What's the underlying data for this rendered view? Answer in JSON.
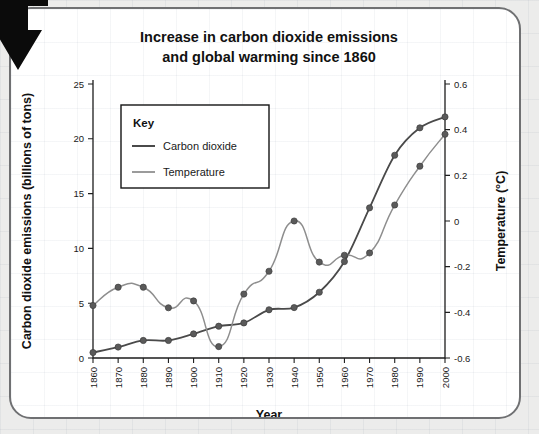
{
  "figure": {
    "title_line1": "Increase in carbon dioxide emissions",
    "title_line2": "and global warming since 1860",
    "corner_marker": "black-arrow-pointer"
  },
  "legend": {
    "heading": "Key",
    "entries": [
      {
        "label": "Carbon dioxide",
        "color": "#4a4a4a",
        "swatch": "line-swatch"
      },
      {
        "label": "Temperature",
        "color": "#9b9b9b",
        "swatch": "line-swatch"
      }
    ]
  },
  "chart_data": {
    "type": "line",
    "xlabel": "Year",
    "ylabel": "Carbon dioxide emissions (billions of tons)",
    "y2label": "Temperature (°C)",
    "grid": false,
    "legend_position": "upper-left-inset",
    "xlim": [
      1860,
      2000
    ],
    "ylim": [
      0,
      25
    ],
    "y2lim": [
      -0.6,
      0.6
    ],
    "xticks": [
      1860,
      1870,
      1880,
      1890,
      1900,
      1910,
      1920,
      1930,
      1940,
      1950,
      1960,
      1970,
      1980,
      1990,
      2000
    ],
    "xtick_labels": [
      "1860",
      "1870",
      "1880",
      "1890",
      "1900",
      "1910",
      "1920",
      "1930",
      "1940",
      "1950",
      "1960",
      "1970",
      "1980",
      "1990",
      "2000"
    ],
    "yticks": [
      0,
      5,
      10,
      15,
      20,
      25
    ],
    "ytick_labels": [
      "0",
      "5",
      "10",
      "15",
      "20",
      "25"
    ],
    "y2ticks": [
      -0.6,
      -0.4,
      -0.2,
      0,
      0.2,
      0.4,
      0.6
    ],
    "y2tick_labels": [
      "-0.6",
      "-0.4",
      "-0.2",
      "0",
      "0.2",
      "0.4",
      "0.6"
    ],
    "x": [
      1860,
      1870,
      1880,
      1890,
      1900,
      1910,
      1920,
      1930,
      1940,
      1950,
      1960,
      1970,
      1980,
      1990,
      2000
    ],
    "series": [
      {
        "name": "Carbon dioxide",
        "axis": "left",
        "units": "billions of tons",
        "color": "#4a4a4a",
        "markers": true,
        "values": [
          0.5,
          1.0,
          1.6,
          1.6,
          2.2,
          2.9,
          3.2,
          4.4,
          4.6,
          6.0,
          8.8,
          13.7,
          18.5,
          21.0,
          22.0
        ]
      },
      {
        "name": "Temperature",
        "axis": "right",
        "units": "°C",
        "color": "#8e8e8e",
        "markers": true,
        "values": [
          -0.37,
          -0.29,
          -0.29,
          -0.38,
          -0.35,
          -0.55,
          -0.32,
          -0.22,
          0.0,
          -0.18,
          -0.15,
          -0.14,
          0.07,
          0.24,
          0.38
        ]
      }
    ]
  }
}
